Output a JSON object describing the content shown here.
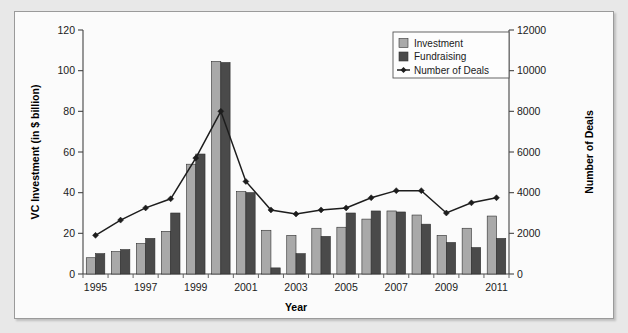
{
  "chart_data": {
    "type": "bar",
    "title": "",
    "xlabel": "Year",
    "ylabel": "VC Investment (in $ billion)",
    "y2label": "Number of Deals",
    "categories": [
      1995,
      1996,
      1997,
      1998,
      1999,
      2000,
      2001,
      2002,
      2003,
      2004,
      2005,
      2006,
      2007,
      2008,
      2009,
      2010,
      2011
    ],
    "xtick_labels": [
      "1995",
      "1997",
      "1999",
      "2001",
      "2003",
      "2005",
      "2007",
      "2009",
      "2011"
    ],
    "ytick_labels": [
      "0",
      "20",
      "40",
      "60",
      "80",
      "100",
      "120"
    ],
    "y2tick_labels": [
      "0",
      "2000",
      "4000",
      "6000",
      "8000",
      "10000",
      "12000"
    ],
    "ylim": [
      0,
      120
    ],
    "y2lim": [
      0,
      12000
    ],
    "grid": false,
    "legend_position": "top-right",
    "series": [
      {
        "name": "Investment",
        "type": "bar",
        "axis": "left",
        "color": "#a9a9a9",
        "values": [
          8,
          11,
          15,
          21,
          54,
          104.5,
          40.5,
          21.5,
          19,
          22.5,
          23,
          27,
          31,
          29,
          19,
          22.5,
          28.5
        ]
      },
      {
        "name": "Fundraising",
        "type": "bar",
        "axis": "left",
        "color": "#4a4a4a",
        "values": [
          10,
          12,
          17.5,
          30,
          59,
          104,
          40,
          3,
          10,
          18.5,
          30,
          31,
          30.5,
          24.5,
          15.5,
          13,
          17.5
        ]
      },
      {
        "name": "Number of Deals",
        "type": "line",
        "axis": "right",
        "color": "#1d1d1d",
        "values": [
          1900,
          2650,
          3250,
          3700,
          5700,
          8000,
          4550,
          3150,
          2950,
          3150,
          3250,
          3750,
          4100,
          4100,
          3000,
          3500,
          3750
        ]
      }
    ],
    "legend": [
      {
        "label": "Investment",
        "marker": "square",
        "color": "#a9a9a9"
      },
      {
        "label": "Fundraising",
        "marker": "square",
        "color": "#4a4a4a"
      },
      {
        "label": "Number of Deals",
        "marker": "line-diamond",
        "color": "#1d1d1d"
      }
    ]
  }
}
